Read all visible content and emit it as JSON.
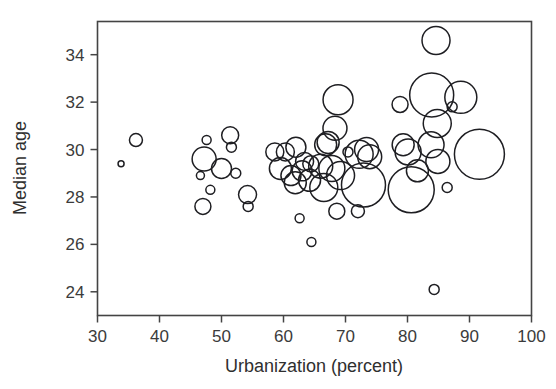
{
  "chart_data": {
    "type": "scatter",
    "title": "",
    "xlabel": "Urbanization (percent)",
    "ylabel": "Median age",
    "xlim": [
      30,
      100
    ],
    "ylim": [
      23.0,
      35.4
    ],
    "xticks": [
      30,
      40,
      50,
      60,
      70,
      80,
      90,
      100
    ],
    "yticks": [
      24,
      26,
      28,
      30,
      32,
      34
    ],
    "xtick_labels": [
      "30",
      "40",
      "50",
      "60",
      "70",
      "80",
      "90",
      "100"
    ],
    "ytick_labels": [
      "24",
      "26",
      "28",
      "30",
      "32",
      "34"
    ],
    "grid": false,
    "legend": null,
    "marker": "open-circle",
    "size_encoding": "bubble area encodes a third variable (population)",
    "series": [
      {
        "name": "countries",
        "points": [
          {
            "x": 33.8,
            "y": 29.4,
            "r": 3.0
          },
          {
            "x": 36.2,
            "y": 30.4,
            "r": 6.5
          },
          {
            "x": 46.6,
            "y": 28.9,
            "r": 4.0
          },
          {
            "x": 47.6,
            "y": 30.4,
            "r": 4.5
          },
          {
            "x": 47.2,
            "y": 29.6,
            "r": 12.0
          },
          {
            "x": 47.0,
            "y": 27.6,
            "r": 8.0
          },
          {
            "x": 48.2,
            "y": 28.3,
            "r": 4.5
          },
          {
            "x": 50.0,
            "y": 29.2,
            "r": 10.0
          },
          {
            "x": 51.4,
            "y": 30.6,
            "r": 8.5
          },
          {
            "x": 51.6,
            "y": 30.1,
            "r": 5.0
          },
          {
            "x": 52.3,
            "y": 29.0,
            "r": 5.0
          },
          {
            "x": 54.2,
            "y": 28.1,
            "r": 9.0
          },
          {
            "x": 54.3,
            "y": 27.6,
            "r": 5.0
          },
          {
            "x": 58.6,
            "y": 29.9,
            "r": 9.0
          },
          {
            "x": 60.3,
            "y": 29.9,
            "r": 9.0
          },
          {
            "x": 59.5,
            "y": 29.2,
            "r": 11.0
          },
          {
            "x": 61.2,
            "y": 28.9,
            "r": 10.0
          },
          {
            "x": 62.0,
            "y": 30.1,
            "r": 10.0
          },
          {
            "x": 61.9,
            "y": 28.6,
            "r": 11.0
          },
          {
            "x": 63.4,
            "y": 29.5,
            "r": 9.0
          },
          {
            "x": 64.4,
            "y": 29.4,
            "r": 8.0
          },
          {
            "x": 63.0,
            "y": 29.1,
            "r": 10.0
          },
          {
            "x": 64.2,
            "y": 28.7,
            "r": 11.0
          },
          {
            "x": 66.5,
            "y": 28.4,
            "r": 14.0
          },
          {
            "x": 62.6,
            "y": 27.1,
            "r": 4.5
          },
          {
            "x": 64.5,
            "y": 26.1,
            "r": 4.5
          },
          {
            "x": 66.8,
            "y": 30.2,
            "r": 11.0
          },
          {
            "x": 67.2,
            "y": 30.3,
            "r": 11.0
          },
          {
            "x": 66.0,
            "y": 29.3,
            "r": 12.0
          },
          {
            "x": 68.3,
            "y": 30.9,
            "r": 12.0
          },
          {
            "x": 68.8,
            "y": 32.1,
            "r": 15.0
          },
          {
            "x": 67.8,
            "y": 29.2,
            "r": 13.0
          },
          {
            "x": 69.2,
            "y": 28.9,
            "r": 14.0
          },
          {
            "x": 68.6,
            "y": 27.4,
            "r": 8.0
          },
          {
            "x": 72.0,
            "y": 27.4,
            "r": 6.5
          },
          {
            "x": 70.4,
            "y": 29.9,
            "r": 5.0
          },
          {
            "x": 72.2,
            "y": 29.8,
            "r": 14.0
          },
          {
            "x": 73.4,
            "y": 30.0,
            "r": 12.0
          },
          {
            "x": 73.9,
            "y": 29.7,
            "r": 12.0
          },
          {
            "x": 72.9,
            "y": 28.5,
            "r": 22.0
          },
          {
            "x": 78.8,
            "y": 31.9,
            "r": 8.0
          },
          {
            "x": 79.3,
            "y": 30.2,
            "r": 11.0
          },
          {
            "x": 80.1,
            "y": 29.9,
            "r": 13.0
          },
          {
            "x": 80.6,
            "y": 28.3,
            "r": 23.0
          },
          {
            "x": 81.6,
            "y": 29.1,
            "r": 11.0
          },
          {
            "x": 83.9,
            "y": 32.3,
            "r": 22.0
          },
          {
            "x": 84.6,
            "y": 34.6,
            "r": 14.0
          },
          {
            "x": 84.8,
            "y": 31.1,
            "r": 14.0
          },
          {
            "x": 83.8,
            "y": 30.2,
            "r": 13.0
          },
          {
            "x": 84.9,
            "y": 29.5,
            "r": 12.0
          },
          {
            "x": 84.3,
            "y": 24.1,
            "r": 5.0
          },
          {
            "x": 87.2,
            "y": 31.8,
            "r": 5.0
          },
          {
            "x": 88.6,
            "y": 32.2,
            "r": 16.0
          },
          {
            "x": 86.4,
            "y": 28.4,
            "r": 5.0
          },
          {
            "x": 91.6,
            "y": 29.8,
            "r": 25.0
          }
        ]
      }
    ]
  },
  "axes": {
    "x_title": "Urbanization (percent)",
    "y_title": "Median age"
  }
}
